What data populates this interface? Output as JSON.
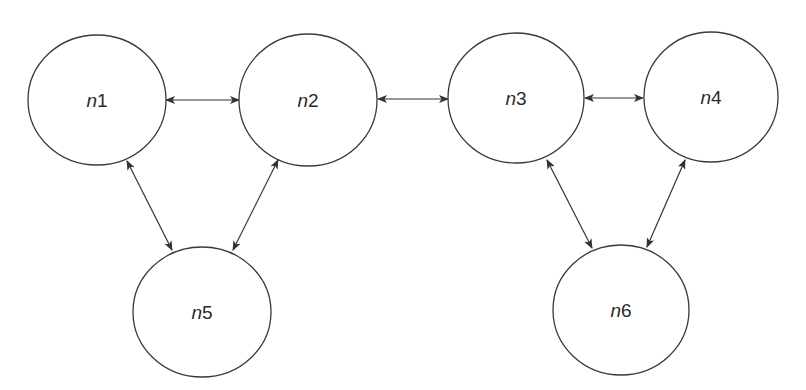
{
  "diagram": {
    "type": "undirected-graph-bidirectional-arrows",
    "colors": {
      "stroke": "#3a3a3a",
      "arrow": "#333333",
      "background": "#ffffff",
      "text": "#2a2a2a"
    },
    "nodes": [
      {
        "id": "n1",
        "prefix": "n",
        "index": "1",
        "cx": 97,
        "cy": 100,
        "rx": 69,
        "ry": 65
      },
      {
        "id": "n2",
        "prefix": "n",
        "index": "2",
        "cx": 308,
        "cy": 100,
        "rx": 69,
        "ry": 66
      },
      {
        "id": "n3",
        "prefix": "n",
        "index": "3",
        "cx": 516,
        "cy": 98,
        "rx": 68,
        "ry": 65
      },
      {
        "id": "n4",
        "prefix": "n",
        "index": "4",
        "cx": 711,
        "cy": 97,
        "rx": 67,
        "ry": 65
      },
      {
        "id": "n5",
        "prefix": "n",
        "index": "5",
        "cx": 202,
        "cy": 312,
        "rx": 69,
        "ry": 65
      },
      {
        "id": "n6",
        "prefix": "n",
        "index": "6",
        "cx": 621,
        "cy": 310,
        "rx": 68,
        "ry": 65
      }
    ],
    "edges": [
      {
        "from": "n1",
        "to": "n2",
        "x1": 166,
        "y1": 100,
        "x2": 239,
        "y2": 100
      },
      {
        "from": "n2",
        "to": "n3",
        "x1": 378,
        "y1": 99,
        "x2": 448,
        "y2": 99
      },
      {
        "from": "n3",
        "to": "n4",
        "x1": 585,
        "y1": 98,
        "x2": 643,
        "y2": 98
      },
      {
        "from": "n1",
        "to": "n5",
        "x1": 127,
        "y1": 161,
        "x2": 172,
        "y2": 250
      },
      {
        "from": "n2",
        "to": "n5",
        "x1": 278,
        "y1": 160,
        "x2": 233,
        "y2": 250
      },
      {
        "from": "n3",
        "to": "n6",
        "x1": 547,
        "y1": 160,
        "x2": 592,
        "y2": 248
      },
      {
        "from": "n4",
        "to": "n6",
        "x1": 685,
        "y1": 160,
        "x2": 647,
        "y2": 247
      }
    ]
  }
}
